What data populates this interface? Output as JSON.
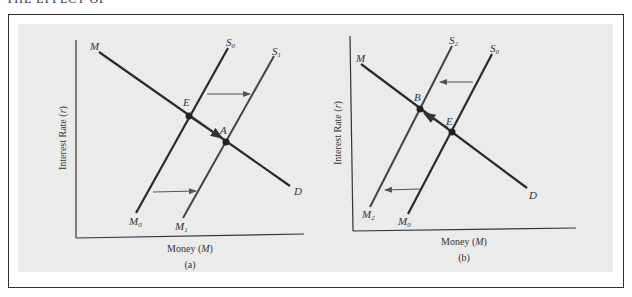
{
  "header": {
    "text": "THE EFFECT OF"
  },
  "panels": [
    {
      "id": "a",
      "caption": "(a)",
      "xlabel": "Money (M)",
      "ylabel": "Interest Rate (r)",
      "labels": {
        "demand_top": "M",
        "demand_bottom": "D",
        "supply_initial_top": "S0",
        "supply_initial_bottom": "M0",
        "supply_new_top": "S1",
        "supply_new_bottom": "M1",
        "eq_initial": "E",
        "eq_new": "A"
      },
      "shift_direction": "right"
    },
    {
      "id": "b",
      "caption": "(b)",
      "xlabel": "Money (M)",
      "ylabel": "Interest Rate (r)",
      "labels": {
        "demand_top": "M",
        "demand_bottom": "D",
        "supply_initial_top": "S0",
        "supply_initial_bottom": "M0",
        "supply_new_top": "S2",
        "supply_new_bottom": "M2",
        "eq_initial": "E",
        "eq_new": "B"
      },
      "shift_direction": "left"
    }
  ],
  "colors": {
    "line": "#2a2a2a",
    "arrow": "#555555",
    "background": "#ebebeb"
  }
}
